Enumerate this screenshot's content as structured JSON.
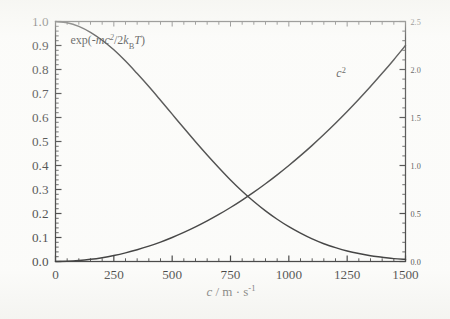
{
  "figure": {
    "background_color": "#fbfbf9",
    "ink_color": "#141414"
  },
  "chart_data": {
    "type": "line",
    "title": "",
    "subtitle": "",
    "xlabel": "c / m · s⁻¹",
    "xlabel_parts": {
      "symbol": "c",
      "separator": " / ",
      "unit_mass": "m",
      "dot": " · ",
      "unit_time": "s",
      "exponent": "-1"
    },
    "ylabel_left": "",
    "ylabel_right": "",
    "xlim": [
      0,
      1500
    ],
    "ylim_left": [
      0.0,
      1.0
    ],
    "ylim_right": [
      0.0,
      2.5
    ],
    "grid": false,
    "legend_position": "inline-annotations",
    "xticks": [
      0,
      250,
      500,
      750,
      1000,
      1250,
      1500
    ],
    "xticklabels": [
      "0",
      "250",
      "500",
      "750",
      "1000",
      "1250",
      "1500"
    ],
    "yticks_left": [
      0.0,
      0.1,
      0.2,
      0.3,
      0.4,
      0.5,
      0.6,
      0.7,
      0.8,
      0.9,
      1.0
    ],
    "yticklabels_left": [
      "0.0",
      "0.1",
      "0.2",
      "0.3",
      "0.4",
      "0.5",
      "0.6",
      "0.7",
      "0.8",
      "0.9",
      "1.0"
    ],
    "yticks_right": [
      0.0,
      0.5,
      1.0,
      1.5,
      2.0,
      2.5
    ],
    "yticklabels_right": [
      "0.0",
      "0.5",
      "1.0",
      "1.5",
      "2.0",
      "2.5"
    ],
    "x_minor_tick_interval": 50,
    "y_left_minor_tick_interval": 0.02,
    "y_right_minor_tick_interval": 0.1,
    "annotations": [
      {
        "name": "boltzmann-factor-label",
        "text": "exp(-mc²/2kBT)",
        "x_data": 330,
        "y_data_left": 0.925,
        "axis": "left"
      },
      {
        "name": "c-squared-label",
        "text": "c²",
        "x_data": 1255,
        "y_data_left": 0.785,
        "axis": "right"
      }
    ],
    "series": [
      {
        "name": "exp(-mc²/2kBT)",
        "axis": "left",
        "label_text": "exp(-mc²/2kBT)",
        "x": [
          0,
          50,
          100,
          150,
          200,
          250,
          300,
          350,
          400,
          450,
          500,
          550,
          600,
          650,
          700,
          750,
          800,
          850,
          900,
          950,
          1000,
          1050,
          1100,
          1150,
          1200,
          1250,
          1300,
          1350,
          1400,
          1450,
          1500
        ],
        "values": [
          1.0,
          0.995,
          0.98,
          0.955,
          0.922,
          0.882,
          0.835,
          0.783,
          0.729,
          0.672,
          0.614,
          0.556,
          0.499,
          0.444,
          0.391,
          0.34,
          0.293,
          0.25,
          0.211,
          0.176,
          0.145,
          0.118,
          0.094,
          0.074,
          0.058,
          0.044,
          0.033,
          0.024,
          0.018,
          0.012,
          0.009
        ]
      },
      {
        "name": "c²",
        "axis": "right",
        "label_text": "c²",
        "x": [
          0,
          50,
          100,
          150,
          200,
          250,
          300,
          350,
          400,
          450,
          500,
          550,
          600,
          650,
          700,
          750,
          800,
          850,
          900,
          950,
          1000,
          1050,
          1100,
          1150,
          1200,
          1250,
          1300,
          1350,
          1400,
          1450,
          1500
        ],
        "values": [
          0.0,
          0.0025,
          0.01,
          0.0225,
          0.04,
          0.0625,
          0.09,
          0.1225,
          0.16,
          0.2025,
          0.25,
          0.3025,
          0.36,
          0.4225,
          0.49,
          0.5625,
          0.64,
          0.7225,
          0.81,
          0.9025,
          1.0,
          1.1025,
          1.21,
          1.3225,
          1.44,
          1.5625,
          1.69,
          1.8225,
          1.96,
          2.1025,
          2.25
        ]
      }
    ],
    "crossing_point": {
      "x_data": 660,
      "y_left": 0.433,
      "y_right": 1.083
    }
  }
}
